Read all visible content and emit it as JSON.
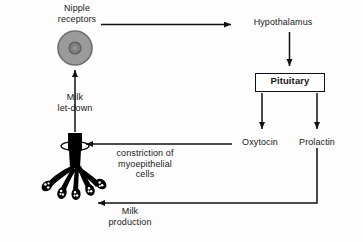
{
  "diagram": {
    "background_color": "#fdfdfd",
    "line_color": "#111111",
    "nipple_fill": "#9a9a9a",
    "nipple_stroke": "#6b6b6b",
    "nipple_inner_fill": "#7a7a7a",
    "duct_fill": "#000000",
    "nodes": {
      "nipple_receptors": {
        "label": "Nipple\nreceptors",
        "name": "nipple-receptors"
      },
      "hypothalamus": {
        "label": "Hypothalamus",
        "name": "hypothalamus"
      },
      "pituitary": {
        "label": "Pituitary",
        "name": "pituitary",
        "boxed": "true"
      },
      "oxytocin": {
        "label": "Oxytocin",
        "name": "oxytocin"
      },
      "prolactin": {
        "label": "Prolactin",
        "name": "prolactin"
      },
      "milk_letdown": {
        "label": "Milk\nlet-down",
        "name": "milk-let-down"
      },
      "constriction": {
        "label": "constriction of\nmyoepithelial\ncells",
        "name": "constriction-of-myoepithelial-cells"
      },
      "milk_production": {
        "label": "Milk\nproduction",
        "name": "milk-production"
      }
    },
    "edges": [
      {
        "id": "nipple-to-hypothalamus",
        "from": "nipple_receptors",
        "to": "hypothalamus",
        "direction": "right"
      },
      {
        "id": "hypothalamus-to-pituitary",
        "from": "hypothalamus",
        "to": "pituitary",
        "direction": "down"
      },
      {
        "id": "pituitary-to-oxytocin",
        "from": "pituitary",
        "to": "oxytocin",
        "direction": "down"
      },
      {
        "id": "pituitary-to-prolactin",
        "from": "pituitary",
        "to": "prolactin",
        "direction": "down"
      },
      {
        "id": "oxytocin-to-myoepithelial",
        "from": "oxytocin",
        "to": "constriction",
        "direction": "left"
      },
      {
        "id": "prolactin-to-alveoli",
        "from": "prolactin",
        "to": "milk_production",
        "direction": "left"
      },
      {
        "id": "duct-to-nipple",
        "from": "constriction",
        "to": "nipple_receptors",
        "direction": "up"
      }
    ]
  }
}
